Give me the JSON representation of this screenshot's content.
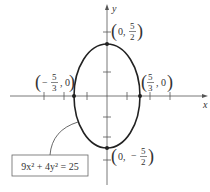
{
  "diagram": {
    "type": "ellipse-graph",
    "equation": "9x² + 4y² = 25",
    "axes": {
      "x_label": "x",
      "y_label": "y"
    },
    "points": [
      {
        "name": "top-vertex",
        "label_prefix": "(0, ",
        "num": "5",
        "den": "2",
        "label_suffix": ")"
      },
      {
        "name": "bottom-vertex",
        "label_prefix": "(0, −",
        "num": "5",
        "den": "2",
        "label_suffix": ")"
      },
      {
        "name": "left-covertex",
        "label_prefix": "(−",
        "num": "5",
        "den": "3",
        "label_suffix": ", 0)"
      },
      {
        "name": "right-covertex",
        "label_prefix": "(",
        "num": "5",
        "den": "3",
        "label_suffix": ", 0)"
      }
    ],
    "colors": {
      "axis": "#555555",
      "curve": "#222222",
      "text": "#333333"
    }
  }
}
